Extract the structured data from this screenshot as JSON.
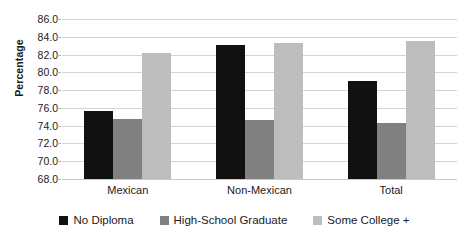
{
  "chart_data": {
    "type": "bar",
    "title": "",
    "xlabel": "",
    "ylabel": "Percentage",
    "categories": [
      "Mexican",
      "Non-Mexican",
      "Total"
    ],
    "series": [
      {
        "name": "No Diploma",
        "color": "#111111",
        "values": [
          75.7,
          83.1,
          79.0
        ]
      },
      {
        "name": "High-School Graduate",
        "color": "#808080",
        "values": [
          74.8,
          74.6,
          74.3
        ]
      },
      {
        "name": "Some College +",
        "color": "#bdbdbd",
        "values": [
          82.2,
          83.3,
          83.5
        ]
      }
    ],
    "ylim": [
      68.0,
      86.0
    ],
    "ytick_step": 2.0,
    "ytick_labels": [
      "86.0",
      "84.0",
      "82.0",
      "80.0",
      "78.0",
      "76.0",
      "74.0",
      "72.0",
      "70.0",
      "68.0"
    ],
    "ytick_values": [
      86.0,
      84.0,
      82.0,
      80.0,
      78.0,
      76.0,
      74.0,
      72.0,
      70.0,
      68.0
    ],
    "grid": true,
    "legend_position": "bottom"
  }
}
